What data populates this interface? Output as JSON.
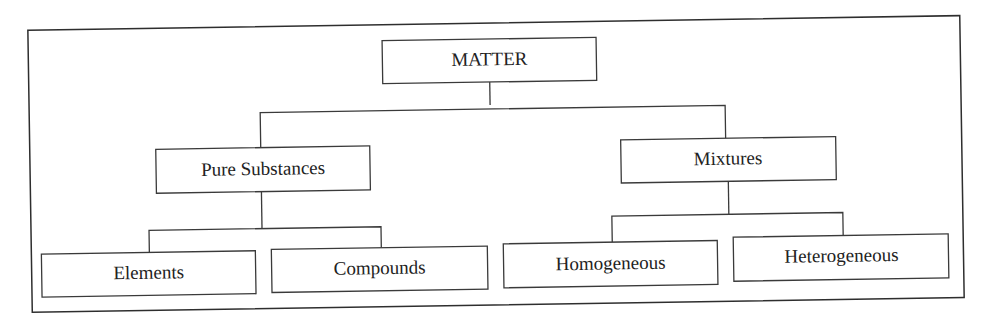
{
  "diagram": {
    "type": "classification-tree",
    "root": {
      "label": "MATTER",
      "children": [
        {
          "label": "Pure Substances",
          "children": [
            {
              "label": "Elements"
            },
            {
              "label": "Compounds"
            }
          ]
        },
        {
          "label": "Mixtures",
          "children": [
            {
              "label": "Homogeneous"
            },
            {
              "label": "Heterogeneous"
            }
          ]
        }
      ]
    }
  },
  "nodes": {
    "matter": "MATTER",
    "pure_substances": "Pure Substances",
    "mixtures": "Mixtures",
    "elements": "Elements",
    "compounds": "Compounds",
    "homogeneous": "Homogeneous",
    "heterogeneous": "Heterogeneous"
  },
  "colors": {
    "line": "#3a3a3a",
    "text": "#222222",
    "background": "#ffffff"
  }
}
